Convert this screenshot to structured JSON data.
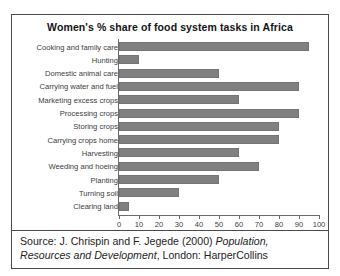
{
  "chart_data": {
    "type": "bar",
    "orientation": "horizontal",
    "title": "Women's % share of food system tasks in Africa",
    "xlabel": "",
    "ylabel": "",
    "xlim": [
      0,
      100
    ],
    "xticks": [
      0,
      10,
      20,
      30,
      40,
      50,
      60,
      70,
      80,
      90,
      100
    ],
    "grid": false,
    "legend": false,
    "bar_color": "#808080",
    "categories": [
      "Cooking and family care",
      "Hunting",
      "Domestic animal care",
      "Carrying water and fuel",
      "Marketing excess crops",
      "Processing crops",
      "Storing crops",
      "Carrying crops home",
      "Harvesting",
      "Weeding and hoeing",
      "Planting",
      "Turning soil",
      "Clearing land"
    ],
    "values": [
      95,
      10,
      50,
      90,
      60,
      90,
      80,
      80,
      60,
      70,
      50,
      30,
      5
    ]
  },
  "source": {
    "prefix": "Source: J. Chrispin and F. Jegede (2000) ",
    "title_italic": "Population, Resources and Development",
    "suffix": ", London: HarperCollins"
  }
}
